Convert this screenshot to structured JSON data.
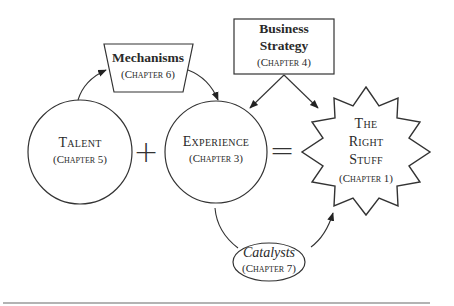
{
  "diagram": {
    "nodes": {
      "talent": {
        "title": "Talent",
        "chapter": "(Chapter 5)",
        "shape": "circle"
      },
      "experience": {
        "title": "Experience",
        "chapter": "(Chapter 3)",
        "shape": "circle"
      },
      "mechanisms": {
        "title": "Mechanisms",
        "chapter": "(Chapter 6)",
        "shape": "trapezoid"
      },
      "business_strategy": {
        "title_line1": "Business",
        "title_line2": "Strategy",
        "chapter": "(Chapter 4)",
        "shape": "rectangle"
      },
      "right_stuff": {
        "line1": "The",
        "line2": "Right",
        "line3": "Stuff",
        "chapter": "(Chapter 1)",
        "shape": "starburst"
      },
      "catalysts": {
        "title": "Catalysts",
        "chapter": "(Chapter 7)",
        "shape": "ellipse"
      }
    },
    "operators": {
      "plus": "+",
      "equals": "="
    },
    "edges": [
      {
        "from": "talent",
        "to": "mechanisms"
      },
      {
        "from": "mechanisms",
        "to": "experience"
      },
      {
        "from": "business_strategy",
        "to": "experience"
      },
      {
        "from": "business_strategy",
        "to": "right_stuff"
      },
      {
        "from": "experience",
        "to": "catalysts"
      },
      {
        "from": "catalysts",
        "to": "right_stuff"
      }
    ],
    "colors": {
      "stroke": "#333333",
      "text": "#2a2a2a",
      "background": "#ffffff",
      "rule": "#9a9a9a"
    }
  }
}
